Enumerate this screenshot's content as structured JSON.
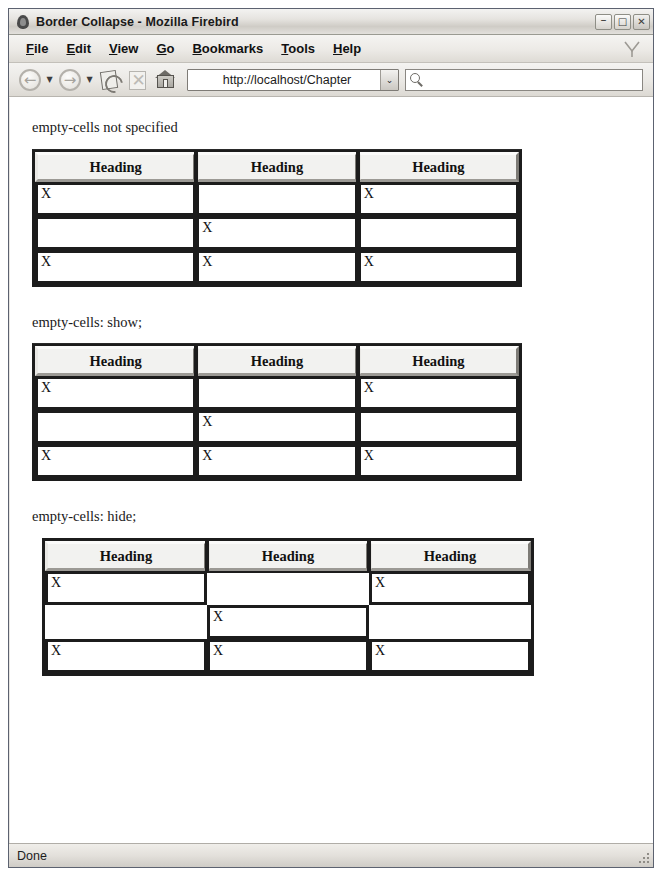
{
  "window": {
    "title": "Border Collapse - Mozilla Firebird",
    "app_icon": "firebird-flame-icon",
    "controls": {
      "minimize": "–",
      "maximize": "□",
      "close": "✕"
    }
  },
  "menubar": {
    "items": [
      {
        "label": "File",
        "accesskey": "F"
      },
      {
        "label": "Edit",
        "accesskey": "E"
      },
      {
        "label": "View",
        "accesskey": "V"
      },
      {
        "label": "Go",
        "accesskey": "G"
      },
      {
        "label": "Bookmarks",
        "accesskey": "B"
      },
      {
        "label": "Tools",
        "accesskey": "T"
      },
      {
        "label": "Help",
        "accesskey": "H"
      }
    ]
  },
  "toolbar": {
    "back_icon": "back-arrow-icon",
    "back_caret": "▼",
    "forward_icon": "forward-arrow-icon",
    "forward_caret": "▼",
    "reload_icon": "reload-icon",
    "stop_icon": "stop-icon",
    "home_icon": "home-icon",
    "back_glyph": "←",
    "forward_glyph": "→",
    "stop_glyph": "✕"
  },
  "address": {
    "value": "http://localhost/Chapter",
    "placeholder": "",
    "dropdown_glyph": "⌄"
  },
  "search": {
    "value": "",
    "placeholder": "",
    "icon": "search-magnifier-icon"
  },
  "content": {
    "sections": [
      {
        "caption": "empty-cells not specified",
        "headers": [
          "Heading",
          "Heading",
          "Heading"
        ],
        "rows": [
          [
            "X",
            "",
            "X"
          ],
          [
            "",
            "X",
            ""
          ],
          [
            "X",
            "X",
            "X"
          ]
        ],
        "empty_cells_mode": "not-specified"
      },
      {
        "caption": "empty-cells: show;",
        "headers": [
          "Heading",
          "Heading",
          "Heading"
        ],
        "rows": [
          [
            "X",
            "",
            "X"
          ],
          [
            "",
            "X",
            ""
          ],
          [
            "X",
            "X",
            "X"
          ]
        ],
        "empty_cells_mode": "show"
      },
      {
        "caption": "empty-cells: hide;",
        "headers": [
          "Heading",
          "Heading",
          "Heading"
        ],
        "rows": [
          [
            "X",
            "",
            "X"
          ],
          [
            "",
            "X",
            ""
          ],
          [
            "X",
            "X",
            "X"
          ]
        ],
        "empty_cells_mode": "hide"
      }
    ]
  },
  "statusbar": {
    "text": "Done",
    "grip": "resize-grip-icon"
  }
}
